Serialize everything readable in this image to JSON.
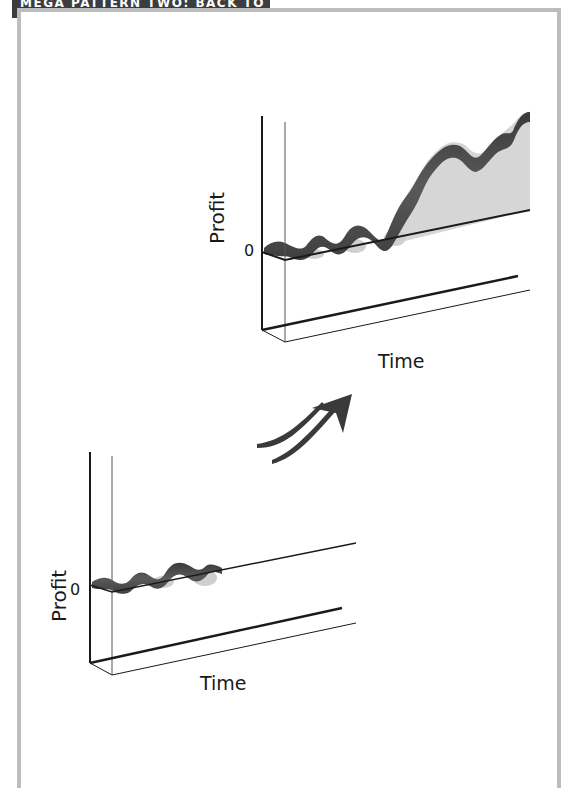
{
  "header": {
    "title": "MEGA PATTERN TWO: BACK TO PROFIT"
  },
  "colors": {
    "tab_bg": "#3d3d3f",
    "frame": "#bdbdbd",
    "ribbon_dark": "#4a4a4a",
    "ribbon_light": "#cfcfcf",
    "fill_area": "#d6d6d6",
    "axis": "#1a1a1a"
  },
  "before_chart": {
    "y_axis_label": "Profit",
    "x_axis_label": "Time",
    "zero_label": "0",
    "description": "Profit oscillating around zero"
  },
  "after_chart": {
    "y_axis_label": "Profit",
    "x_axis_label": "Time",
    "zero_label": "0",
    "description": "Profit oscillates near zero then climbs steadily above zero"
  },
  "transition": {
    "icon": "arrow-up-right-icon"
  }
}
